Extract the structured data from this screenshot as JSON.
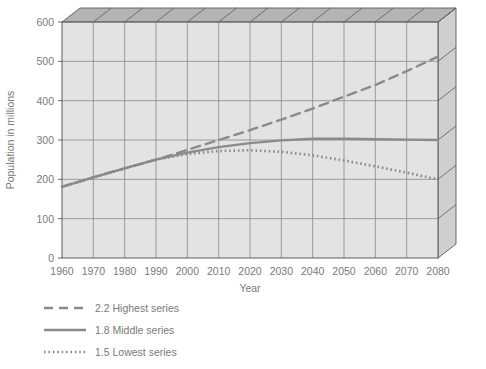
{
  "chart_data": {
    "type": "line",
    "title": "",
    "xlabel": "Year",
    "ylabel": "Population in millions",
    "xlim": [
      1960,
      2080
    ],
    "ylim": [
      0,
      600
    ],
    "grid": true,
    "legend_position": "bottom-left",
    "style": "3d-extruded-plot-area",
    "x": [
      1960,
      1970,
      1980,
      1990,
      2000,
      2010,
      2020,
      2030,
      2040,
      2050,
      2060,
      2070,
      2080
    ],
    "xticklabels": [
      "1960",
      "1970",
      "1980",
      "1990",
      "2000",
      "2010",
      "2020",
      "2030",
      "2040",
      "2050",
      "2060",
      "2070",
      "2080"
    ],
    "yticks": [
      0,
      100,
      200,
      300,
      400,
      500,
      600
    ],
    "yticklabels": [
      "0",
      "100",
      "200",
      "300",
      "400",
      "500",
      "600"
    ],
    "series": [
      {
        "name": "2.2 Highest series",
        "linestyle": "dashed",
        "color": "#8a8a8a",
        "values": [
          181,
          205,
          228,
          250,
          275,
          300,
          325,
          352,
          380,
          410,
          440,
          475,
          512
        ]
      },
      {
        "name": "1.8 Middle series",
        "linestyle": "solid",
        "color": "#8a8a8a",
        "values": [
          181,
          205,
          228,
          250,
          268,
          282,
          292,
          299,
          303,
          303,
          302,
          301,
          300
        ]
      },
      {
        "name": "1.5 Lowest series",
        "linestyle": "dotted",
        "color": "#8a8a8a",
        "values": [
          181,
          205,
          228,
          250,
          264,
          272,
          274,
          270,
          261,
          248,
          233,
          217,
          200
        ]
      }
    ]
  },
  "legend": {
    "items": [
      {
        "label": "2.2 Highest series",
        "style": "dashed"
      },
      {
        "label": "1.8 Middle series",
        "style": "solid"
      },
      {
        "label": "1.5 Lowest series",
        "style": "dotted"
      }
    ]
  },
  "colors": {
    "plot_face": "#e3e3e3",
    "top_face": "#b4b4b4",
    "side_face": "#cfcfcf",
    "grid": "#888888",
    "edge": "#5a5a5a",
    "line": "#8a8a8a",
    "text": "#7a7a7a"
  }
}
